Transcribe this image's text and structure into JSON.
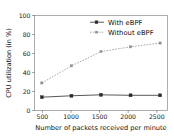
{
  "chart_data": {
    "type": "line",
    "title": "",
    "xlabel": "Number of packets received per minute",
    "ylabel": "CPU utilization (in %)",
    "x": [
      500,
      1000,
      1500,
      2000,
      2500
    ],
    "xtick_labels": [
      "500",
      "1000",
      "1500",
      "2000",
      "2500"
    ],
    "ytick_labels": [
      "0",
      "20",
      "40",
      "60",
      "80",
      "100"
    ],
    "yticks": [
      0,
      20,
      40,
      60,
      80,
      100
    ],
    "xlim": [
      375,
      2625
    ],
    "ylim": [
      0,
      100
    ],
    "grid": false,
    "legend_position": "upper right",
    "series": [
      {
        "name": "With eBPF",
        "values": [
          14,
          15.5,
          16.5,
          16,
          16
        ],
        "line_style": "solid",
        "marker": "square",
        "color": "#2a2a2a"
      },
      {
        "name": "Without eBPF",
        "values": [
          29,
          47,
          62,
          67,
          71
        ],
        "line_style": "dashed",
        "marker": "square",
        "color": "#8f8f8f"
      }
    ]
  },
  "legend": {
    "entries": [
      {
        "label": "With eBPF"
      },
      {
        "label": "Without eBPF"
      }
    ]
  },
  "colors": {
    "background": "#ffffff",
    "frame": "#8a8a8a",
    "text": "#111111",
    "series_with_ebpf": "#2a2a2a",
    "series_without_ebpf": "#8f8f8f"
  }
}
